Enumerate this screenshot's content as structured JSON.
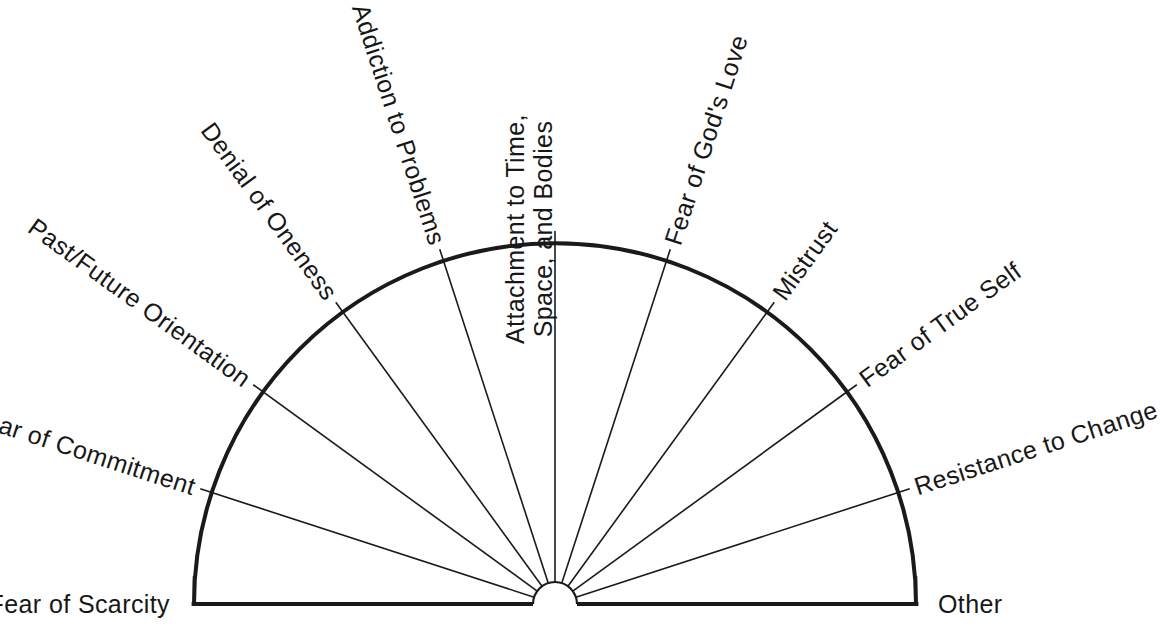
{
  "diagram": {
    "type": "semicircle-spoke-fan",
    "title_caption": "",
    "geometry": {
      "center_x": 555,
      "center_y": 604,
      "outer_radius": 361,
      "hub_radius": 22,
      "tick_overshoot": 12,
      "sector_count": 10,
      "spoke_count": 11,
      "angle_step_degrees": 18
    },
    "colors": {
      "ink": "#1a1a1a",
      "background": "#ffffff",
      "arc_stroke": "#1a1a1a",
      "spoke_stroke": "#1a1a1a"
    },
    "stroke_widths": {
      "arc": 4,
      "baseline": 4,
      "spoke": 1.6,
      "hub": 2.2
    },
    "spokes": [
      {
        "index": 0,
        "angle_degrees": 180,
        "label": "Fear of Scarcity",
        "lines": [
          "Fear of Scarcity"
        ],
        "side": "left"
      },
      {
        "index": 1,
        "angle_degrees": 162,
        "label": "Fear of Commitment",
        "lines": [
          "Fear of Commitment"
        ],
        "side": "left"
      },
      {
        "index": 2,
        "angle_degrees": 144,
        "label": "Past/Future Orientation",
        "lines": [
          "Past/Future Orientation"
        ],
        "side": "left"
      },
      {
        "index": 3,
        "angle_degrees": 126,
        "label": "Denial of Oneness",
        "lines": [
          "Denial of Oneness"
        ],
        "side": "left"
      },
      {
        "index": 4,
        "angle_degrees": 108,
        "label": "Addiction to Problems",
        "lines": [
          "Addiction to Problems"
        ],
        "side": "left"
      },
      {
        "index": 5,
        "angle_degrees": 90,
        "label": "Attachment to Time, Space, and Bodies",
        "lines": [
          "Attachment to Time,",
          "Space, and Bodies"
        ],
        "side": "center"
      },
      {
        "index": 6,
        "angle_degrees": 72,
        "label": "Fear of God's Love",
        "lines": [
          "Fear of God's Love"
        ],
        "side": "right"
      },
      {
        "index": 7,
        "angle_degrees": 54,
        "label": "Mistrust",
        "lines": [
          "Mistrust"
        ],
        "side": "right"
      },
      {
        "index": 8,
        "angle_degrees": 36,
        "label": "Fear of True Self",
        "lines": [
          "Fear of True Self"
        ],
        "side": "right"
      },
      {
        "index": 9,
        "angle_degrees": 18,
        "label": "Resistance to Change",
        "lines": [
          "Resistance to Change"
        ],
        "side": "right"
      },
      {
        "index": 10,
        "angle_degrees": 0,
        "label": "Other",
        "lines": [
          "Other"
        ],
        "side": "right"
      }
    ]
  }
}
